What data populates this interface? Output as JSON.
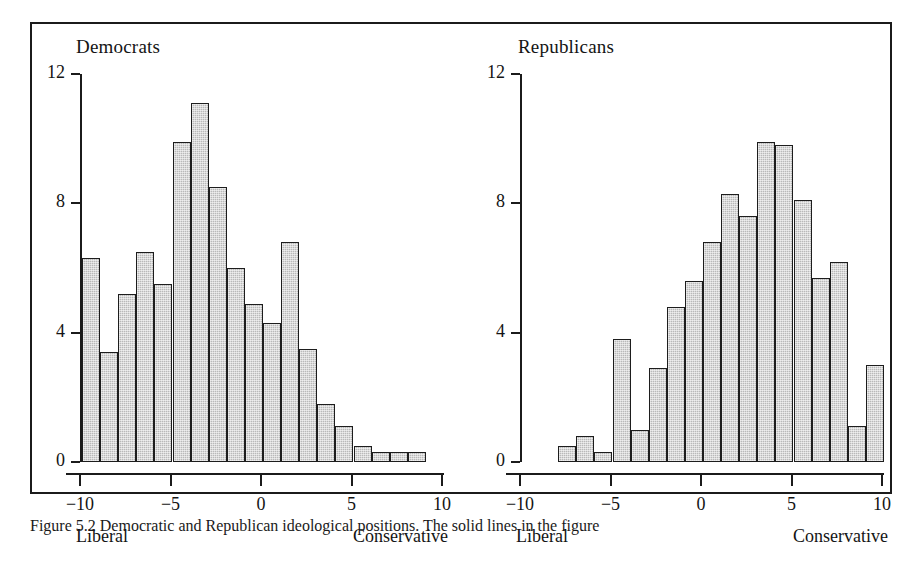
{
  "figure": {
    "caption": "Figure 5.2  Democratic and Republican ideological positions. The solid lines in the figure"
  },
  "chart_data": [
    {
      "type": "bar",
      "title": "Democrats",
      "xlabel": "",
      "ylabel": "",
      "xlim": [
        -10,
        10
      ],
      "ylim": [
        0,
        12
      ],
      "grid": false,
      "legend": null,
      "xticks": [
        "-10",
        "-5",
        "0",
        "5",
        "10"
      ],
      "xtick_values": [
        -10,
        -5,
        0,
        5,
        10
      ],
      "yticks": [
        "0",
        "4",
        "8",
        "12"
      ],
      "ytick_values": [
        0,
        4,
        8,
        12
      ],
      "axis_notes": {
        "left": "Liberal",
        "right": "Conservative"
      },
      "bin_width": 1,
      "bin_starts": [
        -10,
        -9,
        -8,
        -7,
        -6,
        -5,
        -4,
        -3,
        -2,
        -1,
        0,
        1,
        2,
        3,
        4,
        5,
        6,
        7,
        8
      ],
      "values": [
        6.3,
        3.4,
        5.2,
        6.5,
        5.5,
        9.9,
        11.1,
        8.5,
        6.0,
        4.9,
        4.3,
        6.8,
        3.5,
        1.8,
        1.1,
        0.5,
        0.3,
        0.3,
        0.3
      ]
    },
    {
      "type": "bar",
      "title": "Republicans",
      "xlabel": "",
      "ylabel": "",
      "xlim": [
        -10,
        10
      ],
      "ylim": [
        0,
        12
      ],
      "grid": false,
      "legend": null,
      "xticks": [
        "-10",
        "-5",
        "0",
        "5",
        "10"
      ],
      "xtick_values": [
        -10,
        -5,
        0,
        5,
        10
      ],
      "yticks": [
        "0",
        "4",
        "8",
        "12"
      ],
      "ytick_values": [
        0,
        4,
        8,
        12
      ],
      "axis_notes": {
        "left": "Liberal",
        "right": "Conservative"
      },
      "bin_width": 1,
      "bin_starts": [
        -8,
        -7,
        -6,
        -5,
        -4,
        -3,
        -2,
        -1,
        0,
        1,
        2,
        3,
        4,
        5,
        6,
        7,
        8,
        9
      ],
      "values": [
        0.5,
        0.8,
        0.3,
        3.8,
        1.0,
        2.9,
        4.8,
        5.6,
        6.8,
        8.3,
        7.6,
        9.9,
        9.8,
        8.1,
        5.7,
        6.2,
        1.1,
        3.0
      ]
    }
  ],
  "style": {
    "bar_fill": "#b9b9b9",
    "bar_stroke": "#1d1d1d",
    "axis_color": "#1b1b1b",
    "frame_color": "#1b1b1b",
    "text_color": "#141414"
  }
}
